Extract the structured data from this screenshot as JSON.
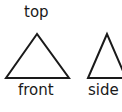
{
  "diagram": {
    "title_label": "top",
    "views": [
      {
        "name": "front",
        "label": "front",
        "shape": "triangle"
      },
      {
        "name": "side",
        "label": "side",
        "shape": "triangle"
      }
    ],
    "colors": {
      "stroke": "#1a1a1a",
      "background": "#ffffff"
    }
  }
}
